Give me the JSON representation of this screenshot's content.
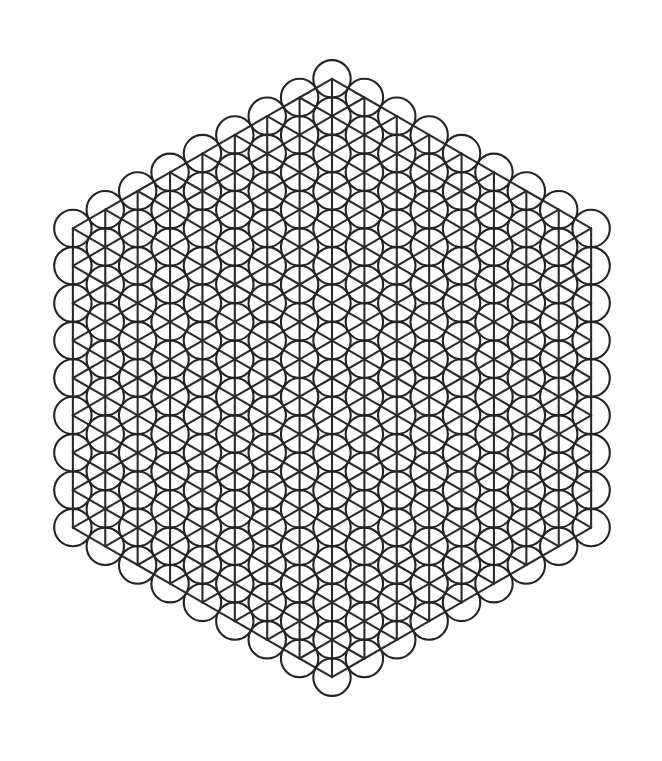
{
  "figure": {
    "title": "Hexagonal triangular-lattice circle packing diagram",
    "background_color": "#ffffff",
    "line_color": "#2b2b2b",
    "circle_color": "#242424",
    "line_width": 2.1,
    "canvas": {
      "width": 662,
      "height": 761
    }
  },
  "lattice": {
    "type": "triangular",
    "orientation": "columns-vertical",
    "center": {
      "x": 332,
      "y": 378
    },
    "nearest_neighbour_spacing": 37.4,
    "column_spacing": 32.39,
    "row_spacing_in_column": 37.4,
    "column_vertical_offset": 18.7,
    "circle_radius": 18.7,
    "hex_rings": 8,
    "site_count": 217,
    "bond_count": 588,
    "extent": {
      "x_min": 33,
      "x_max": 631,
      "y_min": 59,
      "y_max": 697
    }
  },
  "chart_data": {
    "type": "scatter",
    "title": "Hexagonal triangular-lattice circle packing",
    "xlabel": "",
    "ylabel": "",
    "grid": false,
    "legend": null,
    "marker": "open-circle",
    "marker_radius": 18.7,
    "xlim": [
      33,
      631
    ],
    "ylim": [
      59,
      697
    ],
    "note": "Axial hexagonal coordinates (q, r) with |q| <= 8, |r| <= 8, |q + r| <= 8; screen position x = cx + q * 32.39, y = cy + r * 37.4 + q * 18.7",
    "series": [
      {
        "name": "lattice-sites",
        "coordinate_system": "axial-hex",
        "radius_rings": 8,
        "values": [
          0,
          6,
          12,
          18,
          24,
          30,
          36,
          42,
          48
        ],
        "categories": [
          "ring 0",
          "ring 1",
          "ring 2",
          "ring 3",
          "ring 4",
          "ring 5",
          "ring 6",
          "ring 7",
          "ring 8"
        ]
      }
    ]
  }
}
